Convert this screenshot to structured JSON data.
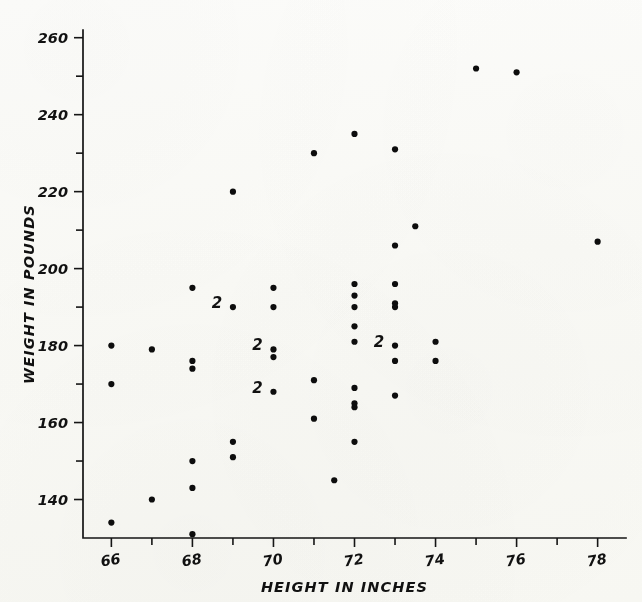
{
  "chart_data": {
    "type": "scatter",
    "title": "",
    "xlabel": "HEIGHT IN INCHES",
    "ylabel": "WEIGHT IN POUNDS",
    "xlim": [
      65.3,
      78.7
    ],
    "ylim": [
      130,
      262
    ],
    "grid": false,
    "legend": null,
    "x_ticks_major": [
      66,
      68,
      70,
      72,
      74,
      76,
      78
    ],
    "x_tick_labels": [
      "66",
      "68",
      "70",
      "72",
      "74",
      "76",
      "78"
    ],
    "x_ticks_minor": [
      67,
      69,
      71,
      73,
      75,
      77
    ],
    "y_ticks_major": [
      140,
      160,
      180,
      200,
      220,
      240,
      260
    ],
    "y_tick_labels": [
      "140",
      "160",
      "180",
      "200",
      "220",
      "240",
      "260"
    ],
    "y_ticks_minor": [
      150,
      170,
      190,
      210,
      230,
      250
    ],
    "point_count_label": "2",
    "points": [
      {
        "x": 66,
        "y": 180,
        "n": 1
      },
      {
        "x": 66,
        "y": 170,
        "n": 1
      },
      {
        "x": 66,
        "y": 134,
        "n": 1
      },
      {
        "x": 67,
        "y": 179,
        "n": 1
      },
      {
        "x": 67,
        "y": 140,
        "n": 1
      },
      {
        "x": 68,
        "y": 195,
        "n": 1
      },
      {
        "x": 68,
        "y": 176,
        "n": 1
      },
      {
        "x": 68,
        "y": 174,
        "n": 1
      },
      {
        "x": 68,
        "y": 150,
        "n": 1
      },
      {
        "x": 68,
        "y": 143,
        "n": 1
      },
      {
        "x": 68,
        "y": 131,
        "n": 1
      },
      {
        "x": 69,
        "y": 220,
        "n": 1
      },
      {
        "x": 69,
        "y": 190,
        "n": 2
      },
      {
        "x": 69,
        "y": 155,
        "n": 1
      },
      {
        "x": 69,
        "y": 151,
        "n": 1
      },
      {
        "x": 70,
        "y": 195,
        "n": 1
      },
      {
        "x": 70,
        "y": 190,
        "n": 1
      },
      {
        "x": 70,
        "y": 179,
        "n": 2
      },
      {
        "x": 70,
        "y": 177,
        "n": 1
      },
      {
        "x": 70,
        "y": 168,
        "n": 2
      },
      {
        "x": 71,
        "y": 230,
        "n": 1
      },
      {
        "x": 71,
        "y": 171,
        "n": 1
      },
      {
        "x": 71,
        "y": 161,
        "n": 1
      },
      {
        "x": 71.5,
        "y": 145,
        "n": 1
      },
      {
        "x": 72,
        "y": 235,
        "n": 1
      },
      {
        "x": 72,
        "y": 196,
        "n": 1
      },
      {
        "x": 72,
        "y": 193,
        "n": 1
      },
      {
        "x": 72,
        "y": 190,
        "n": 1
      },
      {
        "x": 72,
        "y": 185,
        "n": 1
      },
      {
        "x": 72,
        "y": 181,
        "n": 1
      },
      {
        "x": 72,
        "y": 169,
        "n": 1
      },
      {
        "x": 72,
        "y": 165,
        "n": 1
      },
      {
        "x": 72,
        "y": 164,
        "n": 1
      },
      {
        "x": 72,
        "y": 155,
        "n": 1
      },
      {
        "x": 73,
        "y": 231,
        "n": 1
      },
      {
        "x": 73,
        "y": 206,
        "n": 1
      },
      {
        "x": 73,
        "y": 196,
        "n": 1
      },
      {
        "x": 73,
        "y": 191,
        "n": 1
      },
      {
        "x": 73,
        "y": 190,
        "n": 1
      },
      {
        "x": 73,
        "y": 180,
        "n": 2
      },
      {
        "x": 73,
        "y": 176,
        "n": 1
      },
      {
        "x": 73,
        "y": 167,
        "n": 1
      },
      {
        "x": 73.5,
        "y": 211,
        "n": 1
      },
      {
        "x": 74,
        "y": 181,
        "n": 1
      },
      {
        "x": 74,
        "y": 176,
        "n": 1
      },
      {
        "x": 75,
        "y": 252,
        "n": 1
      },
      {
        "x": 76,
        "y": 251,
        "n": 1
      },
      {
        "x": 78,
        "y": 207,
        "n": 1
      }
    ]
  }
}
